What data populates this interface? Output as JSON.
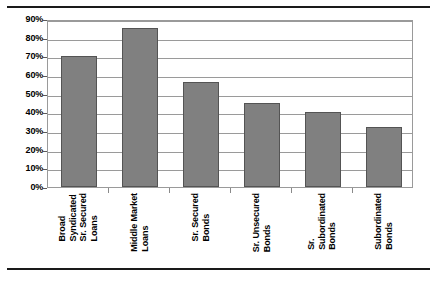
{
  "chart_data": {
    "type": "bar",
    "title": "",
    "subtitle": "",
    "xlabel": "",
    "ylabel": "",
    "categories": [
      "Broad Syndicated Sr. Secured Loans",
      "Middle Market Loans",
      "Sr. Secured Bonds",
      "Sr. Unsecured Bonds",
      "Sr. Subordinated Bonds",
      "Subordinated Bonds"
    ],
    "category_lines": [
      [
        "Broad",
        "Syndicated",
        "Sr. Secured",
        "Loans"
      ],
      [
        "Middle Market",
        "Loans"
      ],
      [
        "Sr. Secured",
        "Bonds"
      ],
      [
        "Sr. Unsecured",
        "Bonds"
      ],
      [
        "Sr.",
        "Subordinated",
        "Bonds"
      ],
      [
        "Subordinated",
        "Bonds"
      ]
    ],
    "values": [
      70,
      85,
      56,
      45,
      40,
      32
    ],
    "ylim": [
      0,
      90
    ],
    "ytick_values": [
      0,
      10,
      20,
      30,
      40,
      50,
      60,
      70,
      80,
      90
    ],
    "ytick_labels": [
      "0%",
      "10%",
      "20%",
      "30%",
      "40%",
      "50%",
      "60%",
      "70%",
      "80%",
      "90%"
    ],
    "grid": true,
    "grid_axis": "y",
    "legend": false,
    "legend_position": "none",
    "bar_color": "#808080",
    "bar_edge_color": "#545454",
    "grid_color": "#9a9a9a",
    "axis_color": "#9a9a9a",
    "rule_color": "#1a1a1a",
    "background_color": "#ffffff",
    "annotations": []
  }
}
